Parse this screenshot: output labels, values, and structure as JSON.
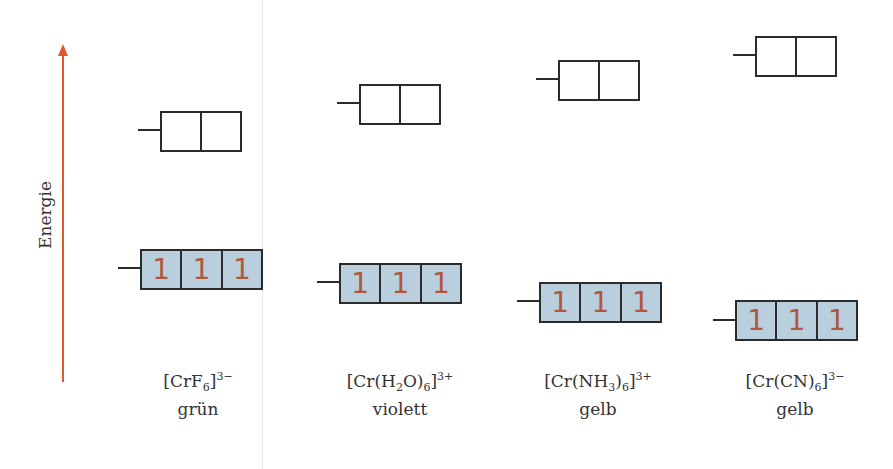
{
  "axis": {
    "label": "Energie",
    "arrow_color": "#e35a2a"
  },
  "colors": {
    "t2g_fill": "#b9cfde",
    "electron": "#b2573a",
    "outline": "#2b2b2b"
  },
  "electron_symbol": "1",
  "complexes": [
    {
      "formula_parts": [
        "[CrF",
        "6",
        "]",
        "3−"
      ],
      "color_name": "grün",
      "eg": {
        "x": 160,
        "y": 111
      },
      "t2g": {
        "x": 140,
        "y": 249
      },
      "label_x": 198
    },
    {
      "formula_parts": [
        "[Cr(H",
        "2",
        "O)",
        "6",
        "]",
        "3+"
      ],
      "color_name": "violett",
      "eg": {
        "x": 359,
        "y": 84
      },
      "t2g": {
        "x": 339,
        "y": 263
      },
      "label_x": 400
    },
    {
      "formula_parts": [
        "[Cr(NH",
        "3",
        ")",
        "6",
        "]",
        "3+"
      ],
      "color_name": "gelb",
      "eg": {
        "x": 558,
        "y": 60
      },
      "t2g": {
        "x": 539,
        "y": 282
      },
      "label_x": 598
    },
    {
      "formula_parts": [
        "[Cr(CN)",
        "6",
        "]",
        "3−"
      ],
      "color_name": "gelb",
      "eg": {
        "x": 755,
        "y": 36
      },
      "t2g": {
        "x": 735,
        "y": 300
      },
      "label_x": 795
    }
  ]
}
